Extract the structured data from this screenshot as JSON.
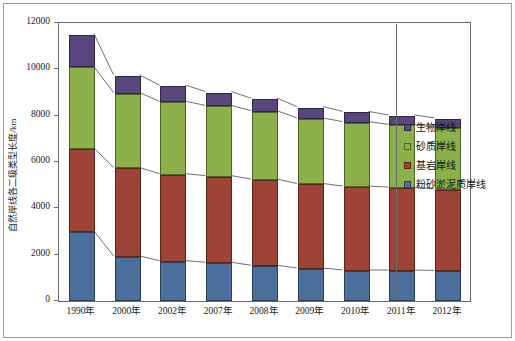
{
  "chart_data": {
    "type": "bar",
    "stacked": true,
    "title": "",
    "subtitle": "",
    "xlabel": "",
    "ylabel": "自然岸线各二级类型长度/km",
    "ylim": [
      0,
      12000
    ],
    "yticks": [
      0,
      2000,
      4000,
      6000,
      8000,
      10000,
      12000
    ],
    "ytick_labels": [
      "0",
      "2000",
      "4000",
      "6000",
      "8000",
      "10000",
      "12000"
    ],
    "grid": false,
    "legend_position": "right",
    "categories": [
      "1990年",
      "2000年",
      "2002年",
      "2007年",
      "2008年",
      "2009年",
      "2010年",
      "2011年",
      "2012年"
    ],
    "series": [
      {
        "name": "粉砂淤泥质岸线",
        "color": "#4a6f9c",
        "values": [
          2980,
          1900,
          1700,
          1630,
          1500,
          1380,
          1300,
          1290,
          1280
        ]
      },
      {
        "name": "基岩岸线",
        "color": "#9e4436",
        "values": [
          3580,
          3820,
          3750,
          3740,
          3720,
          3650,
          3620,
          3580,
          3520
        ]
      },
      {
        "name": "砂质岸线",
        "color": "#8cb14a",
        "values": [
          3520,
          3230,
          3130,
          3030,
          2950,
          2830,
          2780,
          2710,
          2660
        ]
      },
      {
        "name": "生物岸线",
        "color": "#58467c",
        "values": [
          1420,
          760,
          700,
          600,
          540,
          490,
          440,
          410,
          400
        ]
      }
    ],
    "totals": [
      11500,
      9710,
      9280,
      9000,
      8710,
      8350,
      8140,
      7990,
      7860
    ],
    "connector_lines": true
  },
  "legend": {
    "items": [
      {
        "label": "生物岸线",
        "color": "#58467c",
        "swatch_class": "lg-bio"
      },
      {
        "label": "砂质岸线",
        "color": "#8cb14a",
        "swatch_class": "lg-sand"
      },
      {
        "label": "基岩岸线",
        "color": "#9e4436",
        "swatch_class": "lg-rock"
      },
      {
        "label": "粉砂淤泥质岸线",
        "color": "#4a6f9c",
        "swatch_class": "lg-silt"
      }
    ]
  },
  "axes": {
    "y_title": "自然岸线各二级类型长度/km"
  }
}
